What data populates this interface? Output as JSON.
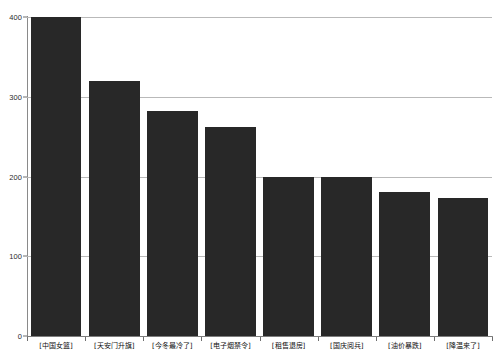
{
  "chart_data": {
    "type": "bar",
    "title": "",
    "subtitle": "",
    "xlabel": "",
    "ylabel": "",
    "categories": [
      "[中国女篮]",
      "[天安门升旗]",
      "[今冬最冷了]",
      "[电子烟禁令]",
      "[租售退房]",
      "[国庆阅兵]",
      "[油价暴跌]",
      "[降温来了]"
    ],
    "values": [
      400,
      320,
      282,
      262,
      200,
      200,
      181,
      173
    ],
    "ylim": [
      0,
      400
    ],
    "yticks": [
      0,
      100,
      200,
      300,
      400
    ],
    "ytick_labels": [
      "0",
      "100",
      "200",
      "300",
      "400"
    ],
    "grid": true,
    "legend": false,
    "bar_color": "#282828",
    "grid_color": "#b9b9b9",
    "axis_color": "#8a8a8a",
    "background_color": "#ffffff"
  }
}
